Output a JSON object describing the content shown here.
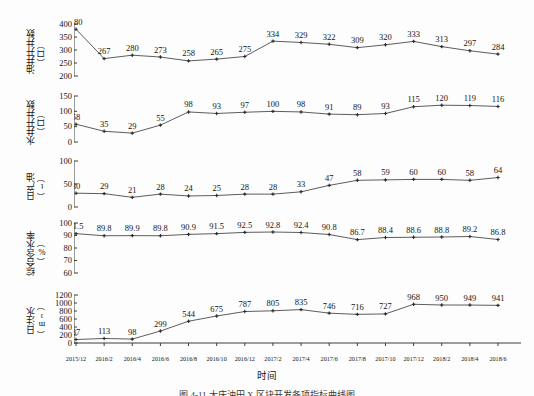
{
  "figure": {
    "xlabel": "时间",
    "caption": "图 4-11  大庆油田 X 区块开发各项指标曲线图",
    "line_color": "#4b4b4b",
    "marker_color": "#2a2a2a",
    "axis_color": "#3c3c3c"
  },
  "chart_data": {
    "type": "line",
    "title": "大庆油田 X 区块开发各项指标曲线图",
    "xlabel": "时间",
    "grid": false,
    "legend": "none",
    "categories": [
      "2015/12",
      "2016/2",
      "2016/4",
      "2016/6",
      "2016/8",
      "2016/10",
      "2016/12",
      "2017/2",
      "2017/4",
      "2017/6",
      "2017/8",
      "2017/10",
      "2017/12",
      "2018/2",
      "2018/4",
      "2018/6"
    ],
    "panels": [
      {
        "id": "oil-wells",
        "ylabel": "油井开井数（口）",
        "ylabel_line1": "油井开井数",
        "ylabel_line2": "（口）",
        "unit": "口",
        "ylim": [
          200,
          400
        ],
        "yticks": [
          200,
          250,
          300,
          350,
          400
        ],
        "values": [
          380,
          267,
          280,
          273,
          258,
          265,
          275,
          334,
          329,
          322,
          309,
          320,
          333,
          313,
          297,
          284
        ]
      },
      {
        "id": "water-wells",
        "ylabel": "水井开井数（口）",
        "ylabel_line1": "水井开井数",
        "ylabel_line2": "（口）",
        "unit": "口",
        "ylim": [
          0,
          150
        ],
        "yticks": [
          0,
          50,
          100,
          150
        ],
        "values": [
          58,
          35,
          29,
          55,
          98,
          93,
          97,
          100,
          98,
          91,
          89,
          93,
          115,
          120,
          119,
          116
        ]
      },
      {
        "id": "daily-oil",
        "ylabel": "日产油（t）",
        "ylabel_line1": "日产油",
        "ylabel_line2": "（t）",
        "unit": "t",
        "ylim": [
          0,
          100
        ],
        "yticks": [
          0,
          50,
          100
        ],
        "values": [
          30,
          29,
          21,
          28,
          24,
          25,
          28,
          28,
          33,
          47,
          58,
          59,
          60,
          60,
          58,
          64
        ]
      },
      {
        "id": "water-cut",
        "ylabel": "综合含水率（%）",
        "ylabel_line1": "综合含水率",
        "ylabel_line2": "（%）",
        "unit": "%",
        "ylim": [
          60,
          100
        ],
        "yticks": [
          60,
          70,
          80,
          90,
          100
        ],
        "values": [
          91.5,
          89.8,
          89.9,
          89.8,
          90.9,
          91.5,
          92.5,
          92.8,
          92.4,
          90.8,
          86.7,
          88.4,
          88.6,
          88.8,
          89.2,
          86.8
        ]
      },
      {
        "id": "daily-injection",
        "ylabel": "日注水（m³）",
        "ylabel_line1": "日注水",
        "ylabel_line2": "（m³）",
        "unit": "m³",
        "ylim": [
          0,
          1200
        ],
        "yticks": [
          0,
          200,
          400,
          600,
          800,
          1000,
          1200
        ],
        "values": [
          87,
          113,
          98,
          299,
          544,
          675,
          787,
          805,
          835,
          746,
          716,
          727,
          968,
          950,
          949,
          941
        ]
      }
    ]
  }
}
